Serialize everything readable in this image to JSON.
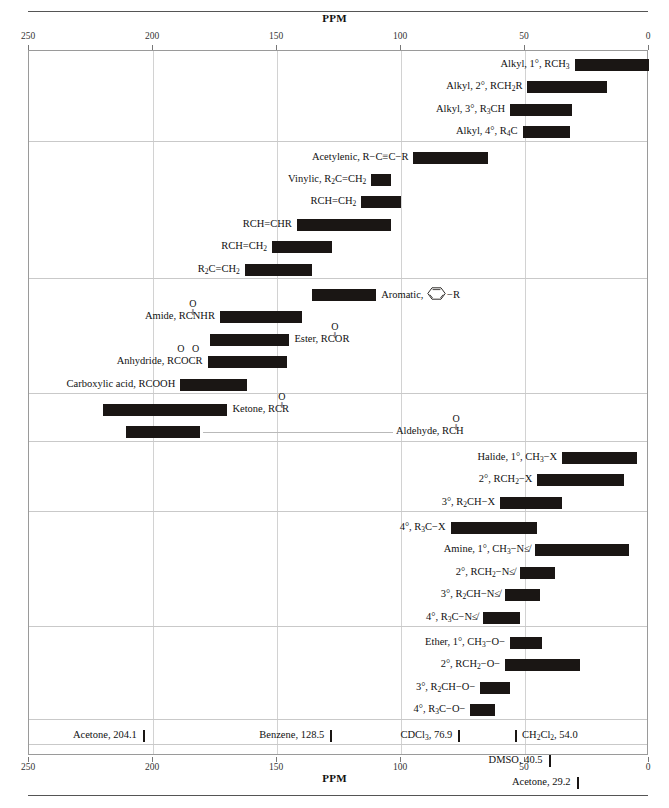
{
  "axis": {
    "label": "PPM",
    "ticks": [
      250,
      200,
      150,
      100,
      50,
      0
    ],
    "min_ppm": 0,
    "max_ppm": 250,
    "tick_labels": [
      "250",
      "200",
      "150",
      "100",
      "50",
      "0"
    ]
  },
  "colors": {
    "bar": "#1a1614",
    "grid": "#d2d2d2",
    "frame": "#9a9a9a",
    "rule": "#555555",
    "text": "#111111"
  },
  "chart_data": {
    "type": "bar",
    "title": "PPM",
    "xlabel": "PPM",
    "ylabel": "",
    "xlim": [
      250,
      0
    ],
    "axis_reversed": true,
    "grid": true,
    "legend": "none",
    "units": "ppm",
    "bars": [
      {
        "label_html": "Alkyl, 1°, RCH<sub>3</sub>",
        "label_text": "Alkyl, 1°, RCH3",
        "from_ppm": 30,
        "to_ppm": 0,
        "label_side": "left",
        "group": 1
      },
      {
        "label_html": "Alkyl, 2°, RCH<sub>2</sub>R",
        "label_text": "Alkyl, 2°, RCH2R",
        "from_ppm": 49,
        "to_ppm": 17,
        "label_side": "left",
        "group": 1
      },
      {
        "label_html": "Alkyl, 3°, R<sub>3</sub>CH",
        "label_text": "Alkyl, 3°, R3CH",
        "from_ppm": 56,
        "to_ppm": 31,
        "label_side": "left",
        "group": 1
      },
      {
        "label_html": "Alkyl, 4°, R<sub>4</sub>C",
        "label_text": "Alkyl, 4°, R4C",
        "from_ppm": 51,
        "to_ppm": 32,
        "label_side": "left",
        "group": 1
      },
      {
        "label_html": "Acetylenic, R−C≡C−R",
        "label_text": "Acetylenic, R-C=C-R",
        "from_ppm": 95,
        "to_ppm": 65,
        "label_side": "left",
        "group": 2
      },
      {
        "label_html": "Vinylic, R<sub>2</sub>C=CH<sub>2</sub>",
        "label_text": "Vinylic, R2C=CH2",
        "from_ppm": 112,
        "to_ppm": 104,
        "label_side": "left",
        "group": 2
      },
      {
        "label_html": "RCH=CH<sub>2</sub>",
        "label_text": "RCH=CH2",
        "from_ppm": 116,
        "to_ppm": 100,
        "label_side": "left",
        "group": 2
      },
      {
        "label_html": "RCH=CHR",
        "label_text": "RCH=CHR",
        "from_ppm": 142,
        "to_ppm": 104,
        "label_side": "left",
        "group": 2
      },
      {
        "label_html": "RCH=CH<sub>2</sub>",
        "label_text": "RCH=CH2",
        "from_ppm": 152,
        "to_ppm": 128,
        "label_side": "left",
        "group": 2
      },
      {
        "label_html": "R<sub>2</sub>C=CH<sub>2</sub>",
        "label_text": "R2C=CH2",
        "from_ppm": 163,
        "to_ppm": 136,
        "label_side": "left",
        "group": 2
      },
      {
        "label_html": "Aromatic,",
        "label_text": "Aromatic,",
        "from_ppm": 136,
        "to_ppm": 110,
        "label_side": "right",
        "group": 3,
        "has_ring": true,
        "ring_suffix": "−R"
      },
      {
        "label_html": "Amide, RC<span class=\"cstack\"><span class=\"o o1\">O</span><span class=\"o o2\">‖</span></span>NHR",
        "label_text": "Amide, RCNHR",
        "from_ppm": 173,
        "to_ppm": 140,
        "label_side": "left",
        "group": 3,
        "carbonyl_at": "after-RC"
      },
      {
        "label_html": "Ester, RC<span class=\"cstack\"><span class=\"o o1\">O</span><span class=\"o o2\">‖</span></span>OR",
        "label_text": "Ester, RCOR",
        "from_ppm": 177,
        "to_ppm": 145,
        "label_side": "right",
        "group": 3
      },
      {
        "label_html": "Anhydride, RC<span class=\"cstack\"><span class=\"o o1\">O</span></span>OC<span class=\"cstack\"><span class=\"o o1\">O</span></span>R",
        "label_text": "Anhydride, RCOCR",
        "from_ppm": 178,
        "to_ppm": 146,
        "label_side": "left",
        "group": 3
      },
      {
        "label_html": "Carboxylic acid, RCOOH",
        "label_text": "Carboxylic acid, RCOOH",
        "from_ppm": 189,
        "to_ppm": 162,
        "label_side": "left",
        "group": 3
      },
      {
        "label_html": "Ketone, RC<span class=\"cstack\"><span class=\"o o1\">O</span><span class=\"o o2\">‖</span></span>R",
        "label_text": "Ketone, RCR",
        "from_ppm": 220,
        "to_ppm": 170,
        "label_side": "right",
        "group": 4
      },
      {
        "label_html": "Aldehyde, RC<span class=\"cstack\"><span class=\"o o1\">O</span><span class=\"o o2\">‖</span></span>H",
        "label_text": "Aldehyde, RCH",
        "from_ppm": 211,
        "to_ppm": 181,
        "label_side": "right-leader",
        "group": 4
      },
      {
        "label_html": "Halide, 1°, CH<sub>3</sub>−X",
        "label_text": "Halide, 1°, CH3-X",
        "from_ppm": 35,
        "to_ppm": 5,
        "label_side": "left",
        "group": 5
      },
      {
        "label_html": "2°, RCH<sub>2</sub>−X",
        "label_text": "2°, RCH2-X",
        "from_ppm": 45,
        "to_ppm": 10,
        "label_side": "left",
        "group": 5
      },
      {
        "label_html": "3°, R<sub>2</sub>CH−X",
        "label_text": "3°, R2CH-X",
        "from_ppm": 60,
        "to_ppm": 35,
        "label_side": "left",
        "group": 5
      },
      {
        "label_html": "4°, R<sub>3</sub>C−X",
        "label_text": "4°, R3C-X",
        "from_ppm": 80,
        "to_ppm": 45,
        "label_side": "left",
        "group": 6
      },
      {
        "label_html": "Amine, 1°, CH<sub>3</sub>−N≰",
        "label_text": "Amine, 1°, CH3-N<",
        "from_ppm": 46,
        "to_ppm": 8,
        "label_side": "left",
        "group": 6
      },
      {
        "label_html": "2°, RCH<sub>2</sub>−N≰",
        "label_text": "2°, RCH2-N<",
        "from_ppm": 52,
        "to_ppm": 38,
        "label_side": "left",
        "group": 6
      },
      {
        "label_html": "3°, R<sub>2</sub>CH−N≰",
        "label_text": "3°, R2CH-N<",
        "from_ppm": 58,
        "to_ppm": 44,
        "label_side": "left",
        "group": 6
      },
      {
        "label_html": "4°, R<sub>3</sub>C−N≰",
        "label_text": "4°, R3C-N<",
        "from_ppm": 67,
        "to_ppm": 52,
        "label_side": "left",
        "group": 6
      },
      {
        "label_html": "Ether, 1°, CH<sub>3</sub>−O−",
        "label_text": "Ether, 1°, CH3-O-",
        "from_ppm": 56,
        "to_ppm": 43,
        "label_side": "left",
        "group": 7
      },
      {
        "label_html": "2°, RCH<sub>2</sub>−O−",
        "label_text": "2°, RCH2-O-",
        "from_ppm": 58,
        "to_ppm": 28,
        "label_side": "left",
        "group": 7
      },
      {
        "label_html": "3°, R<sub>2</sub>CH−O−",
        "label_text": "3°, R2CH-O-",
        "from_ppm": 68,
        "to_ppm": 56,
        "label_side": "left",
        "group": 7
      },
      {
        "label_html": "4°, R<sub>3</sub>C−O−",
        "label_text": "4°, R3C-O-",
        "from_ppm": 72,
        "to_ppm": 62,
        "label_side": "left",
        "group": 7
      }
    ],
    "references": [
      {
        "label_html": "Acetone, 204.1",
        "label_text": "Acetone, 204.1",
        "ppm": 204.1,
        "mark_side": "right",
        "row": 8
      },
      {
        "label_html": "Benzene, 128.5",
        "label_text": "Benzene, 128.5",
        "ppm": 128.5,
        "mark_side": "right",
        "row": 8
      },
      {
        "label_html": "CDCl<sub>3</sub>, 76.9",
        "label_text": "CDCl3, 76.9",
        "ppm": 76.9,
        "mark_side": "right",
        "row": 8
      },
      {
        "label_html": "CH<sub>2</sub>Cl<sub>2</sub>, 54.0",
        "label_text": "CH2Cl2, 54.0",
        "ppm": 54.0,
        "mark_side": "left",
        "row": 8
      },
      {
        "label_html": "DMSO, 40.5",
        "label_text": "DMSO, 40.5",
        "ppm": 40.5,
        "mark_side": "right",
        "row": 9
      },
      {
        "label_html": "Acetone, 29.2",
        "label_text": "Acetone, 29.2",
        "ppm": 29.2,
        "mark_side": "right",
        "row": 9
      }
    ],
    "group_dividers_ppm_rows": [
      1,
      2,
      3,
      4,
      5,
      6,
      7,
      8,
      9
    ]
  }
}
